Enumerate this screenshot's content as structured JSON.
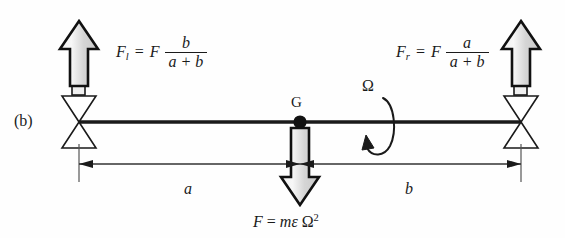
{
  "figure": {
    "panel_label": "(b)",
    "center_of_mass_label": "G",
    "rotation_label": "Ω",
    "left_force": {
      "symbol": "F",
      "subscript": "l",
      "equals": "=",
      "factor": "F",
      "numerator": "b",
      "denominator": "a + b"
    },
    "right_force": {
      "symbol": "F",
      "subscript": "r",
      "equals": "=",
      "factor": "F",
      "numerator": "a",
      "denominator": "a + b"
    },
    "center_force": {
      "symbol": "F",
      "equals": "=",
      "mass": "m",
      "eccentricity": "ε",
      "omega": "Ω",
      "exponent": "2"
    },
    "dimension_left": "a",
    "dimension_right": "b",
    "colors": {
      "line": "#1a1a1a",
      "arrow_outline": "#111111",
      "arrow_fill_top": "#f2f2f2",
      "arrow_fill_bottom": "#cfcfcf",
      "support_fill": "#ffffff",
      "background": "#fefefe"
    }
  }
}
